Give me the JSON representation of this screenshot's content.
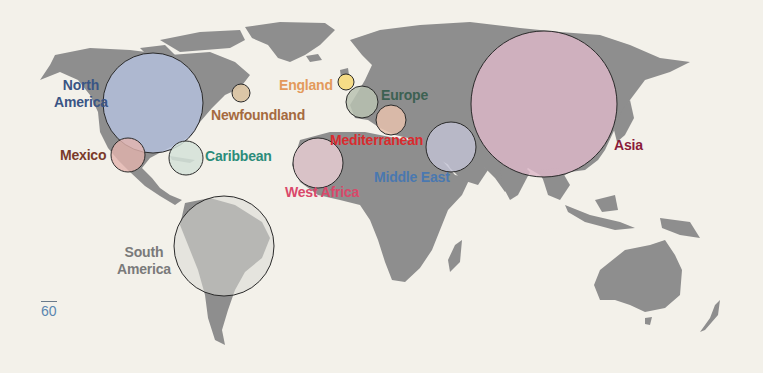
{
  "page_number": "60",
  "regions": [
    {
      "id": "north-america",
      "label_lines": [
        "North",
        "America"
      ],
      "color": "#3a5585",
      "fill": "#b4bfdc",
      "cx": 153,
      "cy": 103,
      "r": 50,
      "label_x": 54,
      "label_y": 77,
      "align": "center"
    },
    {
      "id": "newfoundland",
      "label_lines": [
        "Newfoundland"
      ],
      "color": "#a56a3f",
      "fill": "#d9c3a3",
      "cx": 241,
      "cy": 93,
      "r": 9,
      "label_x": 211,
      "label_y": 107,
      "align": "left"
    },
    {
      "id": "england",
      "label_lines": [
        "England"
      ],
      "color": "#e39a5c",
      "fill": "#f6dc86",
      "cx": 346,
      "cy": 82,
      "r": 8,
      "label_x": 279,
      "label_y": 77,
      "align": "left"
    },
    {
      "id": "europe",
      "label_lines": [
        "Europe"
      ],
      "color": "#3d6152",
      "fill": "#b8c2b1",
      "cx": 362,
      "cy": 102,
      "r": 16,
      "label_x": 381,
      "label_y": 87,
      "align": "left"
    },
    {
      "id": "mediterranean",
      "label_lines": [
        "Mediterranean"
      ],
      "color": "#d92b2e",
      "fill": "#e6c1ad",
      "cx": 391,
      "cy": 120,
      "r": 15,
      "label_x": 330,
      "label_y": 132,
      "align": "left"
    },
    {
      "id": "mexico",
      "label_lines": [
        "Mexico"
      ],
      "color": "#7a3a2a",
      "fill": "#e3b4ae",
      "cx": 128,
      "cy": 155,
      "r": 17,
      "label_x": 60,
      "label_y": 147,
      "align": "left"
    },
    {
      "id": "caribbean",
      "label_lines": [
        "Caribbean"
      ],
      "color": "#2b8c7a",
      "fill": "#d3e2d8",
      "cx": 186,
      "cy": 158,
      "r": 17,
      "label_x": 205,
      "label_y": 148,
      "align": "left"
    },
    {
      "id": "west-africa",
      "label_lines": [
        "West Africa"
      ],
      "color": "#d9486a",
      "fill": "#f1d3d9",
      "cx": 318,
      "cy": 163,
      "r": 25,
      "label_x": 285,
      "label_y": 184,
      "align": "left"
    },
    {
      "id": "middle-east",
      "label_lines": [
        "Middle East"
      ],
      "color": "#4a78b0",
      "fill": "#c3c3d6",
      "cx": 451,
      "cy": 147,
      "r": 25,
      "label_x": 374,
      "label_y": 169,
      "align": "left"
    },
    {
      "id": "asia",
      "label_lines": [
        "Asia"
      ],
      "color": "#8a1b3a",
      "fill": "#ddb7c8",
      "cx": 544,
      "cy": 104,
      "r": 73,
      "label_x": 614,
      "label_y": 137,
      "align": "left"
    },
    {
      "id": "south-america",
      "label_lines": [
        "South",
        "America"
      ],
      "color": "#7a7a7a",
      "fill": "#d8d8d4",
      "cx": 224,
      "cy": 246,
      "r": 50,
      "label_x": 117,
      "label_y": 244,
      "align": "center"
    }
  ],
  "labels": {
    "north_america_1": "North",
    "north_america_2": "America",
    "newfoundland": "Newfoundland",
    "england": "England",
    "europe": "Europe",
    "mediterranean": "Mediterranean",
    "mexico": "Mexico",
    "caribbean": "Caribbean",
    "west_africa": "West Africa",
    "middle_east": "Middle East",
    "asia": "Asia",
    "south_america_1": "South",
    "south_america_2": "America"
  }
}
